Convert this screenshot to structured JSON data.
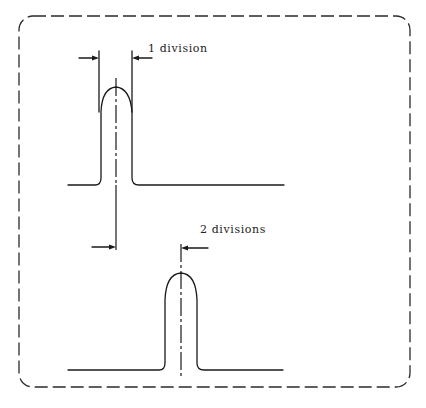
{
  "diagram": {
    "type": "pulse-width-measurement",
    "frame": {
      "style": "dashed-rounded-rectangle",
      "color": "#2a2a2a"
    },
    "stroke_color": "#1a1a1a",
    "pulses": [
      {
        "id": "top",
        "annotation": "1 division",
        "description": "Narrow pulse with width dimensioned between two vertical extension lines"
      },
      {
        "id": "bottom",
        "annotation": "2 divisions",
        "description": "Pulse shifted right relative to the top pulse center line"
      }
    ]
  },
  "labels": {
    "top_pulse": "1 division",
    "bottom_pulse": "2 divisions"
  }
}
